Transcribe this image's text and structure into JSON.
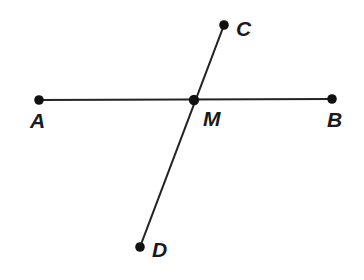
{
  "figure": {
    "width": 364,
    "height": 280,
    "background_color": "#ffffff",
    "line_color": "#232323",
    "dot_color": "#111111",
    "line_width": 2.1,
    "dot_radius": 4.8
  },
  "points": {
    "A": {
      "label": "A",
      "x": 39,
      "y": 100,
      "label_x": 30,
      "label_y": 110
    },
    "B": {
      "label": "B",
      "x": 332,
      "y": 99,
      "label_x": 327,
      "label_y": 109
    },
    "C": {
      "label": "C",
      "x": 224,
      "y": 25,
      "label_x": 236,
      "label_y": 18
    },
    "D": {
      "label": "D",
      "x": 140,
      "y": 247,
      "label_x": 152,
      "label_y": 239
    },
    "M": {
      "label": "M",
      "x": 194,
      "y": 100,
      "label_x": 203,
      "label_y": 108
    }
  },
  "segments": [
    {
      "name": "segment-AB",
      "from": "A",
      "to": "B"
    },
    {
      "name": "segment-CD",
      "from": "C",
      "to": "D"
    }
  ],
  "chart_data": {
    "type": "scatter",
    "xlabel": "",
    "ylabel": "",
    "xlim": [
      0,
      364
    ],
    "ylim": [
      280,
      0
    ],
    "grid": false,
    "legend": "none",
    "labels": [
      "A",
      "B",
      "C",
      "D",
      "M"
    ],
    "x": [
      39,
      332,
      224,
      140,
      194
    ],
    "y": [
      100,
      99,
      25,
      247,
      100
    ],
    "annotations": [
      "Segment AB is drawn nearly horizontally from A to B.",
      "Segment CD is drawn from upper-right C down to lower-left D.",
      "M is the intersection point of AB and CD."
    ]
  }
}
